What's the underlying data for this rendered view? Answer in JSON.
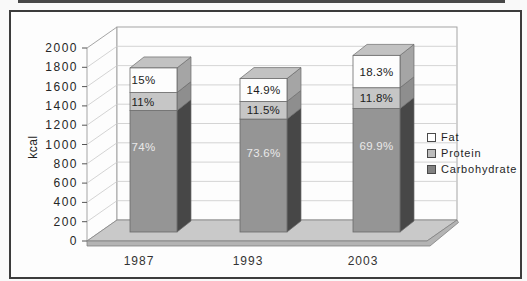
{
  "figure": {
    "legend": [
      {
        "label": "Fat",
        "color": "#ffffff"
      },
      {
        "label": "Protein",
        "color": "#bcbcbc"
      },
      {
        "label": "Carbohydrate",
        "color": "#828282"
      }
    ]
  },
  "chart_data": {
    "type": "bar",
    "subtype": "3d-stacked-column",
    "title": "",
    "ylabel": "kcal",
    "xlabel": "",
    "ylim": [
      0,
      2000
    ],
    "ytick_step": 200,
    "yticks": [
      0,
      200,
      400,
      600,
      800,
      1000,
      1200,
      1400,
      1600,
      1800,
      2000
    ],
    "grid": true,
    "legend_position": "right",
    "legend_order": [
      "Fat",
      "Protein",
      "Carbohydrate"
    ],
    "categories": [
      "1987",
      "1993",
      "2003"
    ],
    "totals_kcal_est": [
      1700,
      1590,
      1830
    ],
    "series": [
      {
        "name": "Carbohydrate",
        "pct": [
          74,
          73.6,
          69.9
        ],
        "labels": [
          "74%",
          "73.6%",
          "69.9%"
        ],
        "color_front": "#959595",
        "color_side": "#474747",
        "color_top": "#b0b0b0",
        "label_color": "#e9e9e9"
      },
      {
        "name": "Protein",
        "pct": [
          11,
          11.5,
          11.8
        ],
        "labels": [
          "11%",
          "11.5%",
          "11.8%"
        ],
        "color_front": "#c6c6c6",
        "color_side": "#8e8e8e",
        "color_top": "#d4d4d4",
        "label_color": "#1c1c1c"
      },
      {
        "name": "Fat",
        "pct": [
          15,
          14.9,
          18.3
        ],
        "labels": [
          "15%",
          "14.9%",
          "18.3%"
        ],
        "color_front": "#fdfdfd",
        "color_side": "#a5a5a5",
        "color_top": "#c2c2c2",
        "label_color": "#1c1c1c"
      }
    ]
  }
}
